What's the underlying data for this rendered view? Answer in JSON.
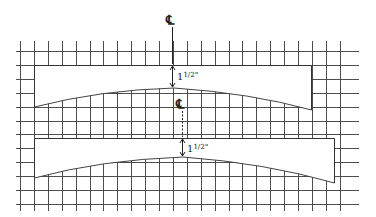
{
  "diagram": {
    "type": "technical-drawing",
    "grid": {
      "x_start": 20,
      "x_end": 353,
      "y_start": 51,
      "y_end": 205,
      "spacing": 13.9,
      "color": "#3a3a3a"
    },
    "panels": [
      {
        "name": "upper-panel",
        "left": 34,
        "right": 311,
        "top": 65,
        "bottom_left": 107,
        "bottom_right": 110,
        "curve_peak_y": 88,
        "curve_peak_x": 174
      },
      {
        "name": "lower-panel",
        "left": 34,
        "right": 334,
        "top": 138,
        "bottom_left": 178,
        "bottom_right": 183,
        "curve_peak_y": 157,
        "curve_peak_x": 183
      }
    ],
    "centerlines": [
      {
        "symbol": "℄",
        "x": 172,
        "label_y": 22
      },
      {
        "symbol": "℄",
        "x": 182,
        "label_y": 106
      }
    ],
    "dimensions": [
      {
        "label_whole": "1",
        "label_frac": "1/2",
        "unit": "\"",
        "text": "1½\""
      },
      {
        "label_whole": "1",
        "label_frac": "1/2",
        "unit": "\"",
        "text": "1½\""
      }
    ]
  }
}
